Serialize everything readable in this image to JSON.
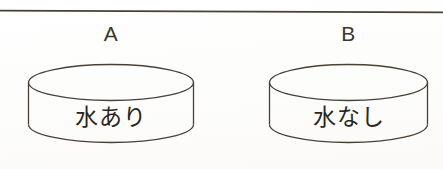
{
  "figure": {
    "background_color": "#fefefe",
    "line_color": "#4a4034",
    "text_color": "#2b2520",
    "divider": {
      "name": "horizontal-rule",
      "color": "#4a4034"
    },
    "vessels": [
      {
        "id": "a",
        "label": "A",
        "caption": "水あり",
        "caption_meaning": "with water",
        "shape": "cylinder"
      },
      {
        "id": "b",
        "label": "B",
        "caption": "水なし",
        "caption_meaning": "without water",
        "shape": "cylinder"
      }
    ]
  }
}
